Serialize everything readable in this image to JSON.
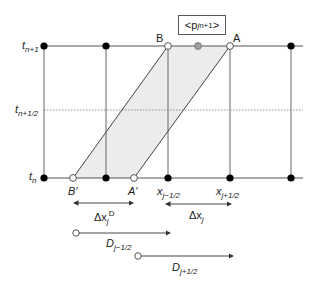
{
  "diagram": {
    "time_levels": [
      {
        "id": "t_n+1",
        "base": "t",
        "sub": "n+1"
      },
      {
        "id": "t_n+1/2",
        "base": "t",
        "sub": "n+1/2"
      },
      {
        "id": "t_n",
        "base": "t",
        "sub": "n"
      }
    ],
    "points": {
      "B": "B",
      "A": "A",
      "B_prime": "B'",
      "A_prime": "A'"
    },
    "cell_average_box": {
      "open": "<p",
      "sub": "j",
      "sup": "n+1",
      "close": ">"
    },
    "x_labels": [
      {
        "base": "x",
        "sub": "j−1/2"
      },
      {
        "base": "x",
        "sub": "j+1/2"
      }
    ],
    "intervals": {
      "departure_width": {
        "base": "Δx",
        "sub": "j",
        "sup": "D"
      },
      "cell_width": {
        "base": "Δx",
        "sub": "j"
      }
    },
    "trajectories": [
      {
        "base": "D",
        "sub": "j−1/2"
      },
      {
        "base": "D",
        "sub": "j+1/2"
      }
    ],
    "colors": {
      "line": "#555555",
      "shade": "#ececec",
      "node_filled": "#000000",
      "node_gray": "#a0a0a0"
    }
  }
}
